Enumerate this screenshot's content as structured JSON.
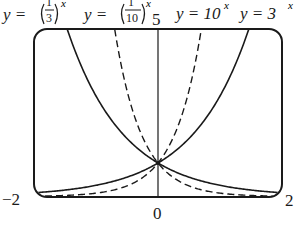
{
  "chart_data": {
    "type": "line",
    "title": "",
    "xlabel": "",
    "ylabel": "",
    "xlim": [
      -2,
      2
    ],
    "ylim": [
      0,
      5
    ],
    "grid": false,
    "legend_position": "top (inline labels above plot)",
    "tick_labels": {
      "x_left": "−2",
      "x_right": "2",
      "x_center": "0",
      "y_top": "5"
    },
    "series": [
      {
        "name": "y = (1/3)^x",
        "style": "solid",
        "x": [
          -2,
          -1.465,
          -1,
          0,
          1,
          2
        ],
        "values": [
          9,
          5,
          3,
          1,
          0.333,
          0.111
        ]
      },
      {
        "name": "y = (1/10)^x",
        "style": "dashed",
        "x": [
          -2,
          -0.699,
          -0.5,
          0,
          1,
          2
        ],
        "values": [
          100,
          5,
          3.162,
          1,
          0.1,
          0.01
        ]
      },
      {
        "name": "y = 10^x",
        "style": "dashed",
        "x": [
          -2,
          -1,
          0,
          0.5,
          0.699,
          2
        ],
        "values": [
          0.01,
          0.1,
          1,
          3.162,
          5,
          100
        ]
      },
      {
        "name": "y = 3^x",
        "style": "solid",
        "x": [
          -2,
          -1,
          0,
          1,
          1.465,
          2
        ],
        "values": [
          0.111,
          0.333,
          1,
          3,
          5,
          9
        ]
      }
    ],
    "annotations": [
      "All curves intersect at (0, 1)"
    ]
  },
  "labels": {
    "l1_prefix": "y = ",
    "l1_num": "1",
    "l1_den": "3",
    "l1_sup": "x",
    "l2_prefix": "y = ",
    "l2_num": "1",
    "l2_den": "10",
    "l2_sup": "x",
    "y_top_tick": "5",
    "l3": "y = 10",
    "l3_sup": "x",
    "l4": "y = 3",
    "l4_sup": "x",
    "x_min": "−2",
    "x_max": "2",
    "x_zero": "0"
  }
}
